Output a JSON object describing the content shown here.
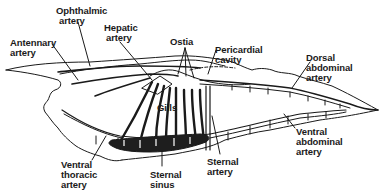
{
  "diagram": {
    "labels": {
      "ophthalmic_artery": [
        "Ophthalmic",
        "artery"
      ],
      "antennary_artery": [
        "Antennary",
        "artery"
      ],
      "hepatic_artery": [
        "Hepatic",
        "artery"
      ],
      "ostia": [
        "Ostia"
      ],
      "pericardial_cavity": [
        "Pericardial",
        "cavity"
      ],
      "dorsal_abdominal_artery": [
        "Dorsal",
        "abdominal",
        "artery"
      ],
      "gills": [
        "Gills"
      ],
      "ventral_abdominal_artery": [
        "Ventral",
        "abdominal",
        "artery"
      ],
      "ventral_thoracic_artery": [
        "Ventral",
        "thoracic",
        "artery"
      ],
      "sternal_sinus": [
        "Sternal",
        "sinus"
      ],
      "sternal_artery": [
        "Sternal",
        "artery"
      ]
    },
    "colors": {
      "ink": "#1a1a1a",
      "background": "#ffffff",
      "sinus_fill": "#1e1e1e"
    }
  }
}
